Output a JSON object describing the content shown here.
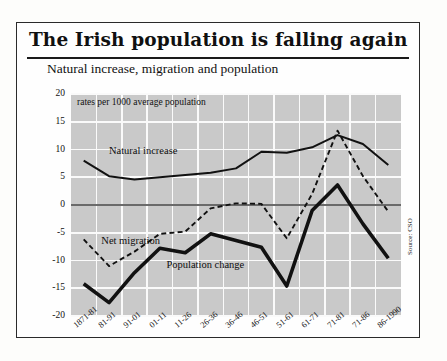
{
  "title": "The Irish population is falling again",
  "subtitle": "Natural increase, migration and population",
  "units_note": "rates per 1000 average population",
  "source": "Source: CSO",
  "series_labels": {
    "natural": "Natural increase",
    "migration": "Net migration",
    "population": "Population change"
  },
  "chart_data": {
    "type": "line",
    "title": "The Irish population is falling again",
    "subtitle": "Natural increase, migration and population",
    "xlabel": "",
    "ylabel": "rates per 1000 average population",
    "ylim": [
      -20,
      20
    ],
    "yticks": [
      20,
      15,
      10,
      5,
      0,
      -5,
      -10,
      -15,
      -20
    ],
    "grid": true,
    "legend": "inline-annotations",
    "categories": [
      "1871-81",
      "81-91",
      "91-01",
      "01-11",
      "11-26",
      "26-36",
      "36-46",
      "46-51",
      "51-61",
      "61-71",
      "71-81",
      "71-86",
      "86-1990"
    ],
    "series": [
      {
        "name": "Natural increase",
        "style": "solid-thin",
        "values": [
          8.0,
          5.2,
          4.6,
          5.0,
          5.4,
          5.8,
          6.6,
          9.6,
          9.4,
          10.4,
          12.6,
          11.0,
          7.2
        ]
      },
      {
        "name": "Net migration",
        "style": "dashed",
        "values": [
          -6.2,
          -11.0,
          -8.4,
          -5.2,
          -4.8,
          -0.6,
          0.3,
          0.2,
          -6.0,
          2.0,
          13.4,
          5.2,
          -1.2
        ]
      },
      {
        "name": "Population change",
        "style": "solid-thick",
        "values": [
          -14.2,
          -17.6,
          -12.2,
          -7.8,
          -8.6,
          -5.2,
          -6.4,
          -7.6,
          -14.6,
          -1.0,
          3.6,
          -3.4,
          -9.6
        ]
      }
    ]
  },
  "colors": {
    "plot_background": "#c9c9c9",
    "gridline": "#fafafa",
    "axis": "#3a3a3a",
    "line": "#111111",
    "frame": "#2a2a2a"
  }
}
